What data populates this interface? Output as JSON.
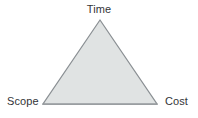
{
  "diagram": {
    "type": "triangle-diagram",
    "background_color": "#ffffff",
    "shape": {
      "name": "triple-constraint-triangle",
      "fill_color": "#e0e3e3",
      "stroke_color": "#8a8f93",
      "stroke_width": 1.2,
      "vertices": [
        {
          "id": "apex",
          "x": 100,
          "y": 20
        },
        {
          "id": "bottom-left",
          "x": 43,
          "y": 104
        },
        {
          "id": "bottom-right",
          "x": 157,
          "y": 104
        }
      ]
    },
    "labels": {
      "top": "Time",
      "left": "Scope",
      "right": "Cost"
    },
    "label_color": "#333538"
  }
}
